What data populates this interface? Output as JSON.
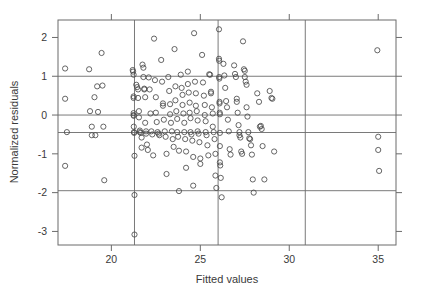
{
  "chart_data": {
    "type": "scatter",
    "title": "",
    "xlabel": "Fitted values",
    "ylabel": "Normalized residuals",
    "xlim": [
      17.0,
      36.0
    ],
    "ylim": [
      -3.35,
      2.45
    ],
    "xticks": [
      20,
      25,
      30,
      35
    ],
    "yticks": [
      2,
      1,
      0,
      -1,
      -2,
      -3
    ],
    "xtick_labels": [
      "20",
      "25",
      "30",
      "35"
    ],
    "ytick_labels": [
      "2",
      "1",
      "0",
      "-1",
      "-2",
      "-3"
    ],
    "grid": false,
    "legend": "none",
    "marker": "open-circle",
    "marker_size": 2.6,
    "marker_color": "#4a4a4a",
    "frame_color": "#6b6b6b",
    "reference_lines": {
      "vertical": [
        21.3,
        26.0,
        30.9
      ],
      "horizontal": [
        1.0,
        0.0,
        -0.45,
        -1.95
      ],
      "color": "#6b6b6b"
    },
    "points": [
      [
        17.4,
        1.2
      ],
      [
        17.4,
        0.42
      ],
      [
        17.4,
        -1.31
      ],
      [
        17.5,
        -0.44
      ],
      [
        18.75,
        1.18
      ],
      [
        18.8,
        0.1
      ],
      [
        18.9,
        -0.3
      ],
      [
        18.9,
        -0.52
      ],
      [
        19.05,
        0.46
      ],
      [
        19.1,
        -0.52
      ],
      [
        19.2,
        0.74
      ],
      [
        19.25,
        0.08
      ],
      [
        19.45,
        1.6
      ],
      [
        19.5,
        0.76
      ],
      [
        19.55,
        -0.3
      ],
      [
        19.6,
        -1.68
      ],
      [
        21.2,
        1.16
      ],
      [
        21.22,
        1.12
      ],
      [
        21.25,
        1.04
      ],
      [
        21.25,
        0.48
      ],
      [
        21.25,
        0.44
      ],
      [
        21.25,
        0.05
      ],
      [
        21.25,
        0.0
      ],
      [
        21.26,
        -0.02
      ],
      [
        21.26,
        -0.3
      ],
      [
        21.27,
        -0.44
      ],
      [
        21.28,
        -0.46
      ],
      [
        21.3,
        -1.05
      ],
      [
        21.3,
        -2.06
      ],
      [
        21.3,
        -3.08
      ],
      [
        21.4,
        0.78
      ],
      [
        21.45,
        0.72
      ],
      [
        21.5,
        0.66
      ],
      [
        21.5,
        0.44
      ],
      [
        21.55,
        0.1
      ],
      [
        21.55,
        -0.06
      ],
      [
        21.6,
        -0.4
      ],
      [
        21.6,
        -0.44
      ],
      [
        21.65,
        -0.46
      ],
      [
        21.7,
        -0.58
      ],
      [
        21.7,
        -0.84
      ],
      [
        21.75,
        1.3
      ],
      [
        21.8,
        1.22
      ],
      [
        21.8,
        0.98
      ],
      [
        21.85,
        0.68
      ],
      [
        21.85,
        0.66
      ],
      [
        21.9,
        0.46
      ],
      [
        21.9,
        -0.2
      ],
      [
        21.95,
        -0.42
      ],
      [
        21.95,
        -0.48
      ],
      [
        22.0,
        -0.76
      ],
      [
        22.05,
        -0.9
      ],
      [
        22.1,
        0.97
      ],
      [
        22.15,
        0.66
      ],
      [
        22.2,
        0.04
      ],
      [
        22.25,
        -0.42
      ],
      [
        22.3,
        -0.5
      ],
      [
        22.35,
        -1.04
      ],
      [
        22.4,
        1.97
      ],
      [
        22.45,
        0.9
      ],
      [
        22.5,
        0.46
      ],
      [
        22.5,
        0.06
      ],
      [
        22.55,
        -0.18
      ],
      [
        22.6,
        -0.44
      ],
      [
        22.65,
        -0.48
      ],
      [
        22.7,
        -0.52
      ],
      [
        22.8,
        1.42
      ],
      [
        22.85,
        0.86
      ],
      [
        22.9,
        0.3
      ],
      [
        22.9,
        0.24
      ],
      [
        22.95,
        -0.12
      ],
      [
        23.0,
        -0.42
      ],
      [
        23.05,
        -0.56
      ],
      [
        23.1,
        -1.0
      ],
      [
        23.1,
        -1.52
      ],
      [
        23.2,
        0.98
      ],
      [
        23.25,
        0.62
      ],
      [
        23.3,
        0.28
      ],
      [
        23.3,
        0.02
      ],
      [
        23.35,
        -0.2
      ],
      [
        23.4,
        -0.42
      ],
      [
        23.45,
        -0.62
      ],
      [
        23.5,
        -0.82
      ],
      [
        23.55,
        1.7
      ],
      [
        23.6,
        0.74
      ],
      [
        23.6,
        0.38
      ],
      [
        23.65,
        0.1
      ],
      [
        23.7,
        -0.1
      ],
      [
        23.7,
        -0.44
      ],
      [
        23.75,
        -0.56
      ],
      [
        23.8,
        -0.92
      ],
      [
        23.8,
        -1.96
      ],
      [
        23.9,
        1.04
      ],
      [
        23.95,
        0.7
      ],
      [
        24.0,
        0.52
      ],
      [
        24.0,
        0.26
      ],
      [
        24.05,
        0.04
      ],
      [
        24.1,
        -0.2
      ],
      [
        24.1,
        -0.44
      ],
      [
        24.15,
        -0.62
      ],
      [
        24.2,
        -0.94
      ],
      [
        24.2,
        -1.36
      ],
      [
        24.3,
        1.12
      ],
      [
        24.3,
        0.8
      ],
      [
        24.35,
        0.58
      ],
      [
        24.4,
        0.32
      ],
      [
        24.4,
        0.06
      ],
      [
        24.45,
        -0.08
      ],
      [
        24.45,
        -0.44
      ],
      [
        24.5,
        -0.5
      ],
      [
        24.55,
        -0.66
      ],
      [
        24.6,
        -1.08
      ],
      [
        24.6,
        -1.82
      ],
      [
        24.65,
        2.11
      ],
      [
        24.7,
        0.86
      ],
      [
        24.75,
        0.56
      ],
      [
        24.75,
        0.24
      ],
      [
        24.8,
        0.1
      ],
      [
        24.85,
        -0.14
      ],
      [
        24.85,
        -0.42
      ],
      [
        24.9,
        -0.48
      ],
      [
        24.95,
        -0.7
      ],
      [
        25.0,
        -1.12
      ],
      [
        25.0,
        -1.26
      ],
      [
        25.1,
        1.55
      ],
      [
        25.15,
        0.84
      ],
      [
        25.2,
        0.5
      ],
      [
        25.25,
        0.26
      ],
      [
        25.25,
        0.0
      ],
      [
        25.3,
        -0.16
      ],
      [
        25.3,
        -0.44
      ],
      [
        25.35,
        -0.52
      ],
      [
        25.4,
        -0.78
      ],
      [
        25.45,
        -1.04
      ],
      [
        25.5,
        1.05
      ],
      [
        25.55,
        1.04
      ],
      [
        25.6,
        0.6
      ],
      [
        25.6,
        0.56
      ],
      [
        25.65,
        0.2
      ],
      [
        25.7,
        0.04
      ],
      [
        25.7,
        -0.3
      ],
      [
        25.75,
        -0.44
      ],
      [
        25.8,
        -0.62
      ],
      [
        25.85,
        -1.0
      ],
      [
        25.85,
        -1.56
      ],
      [
        25.9,
        -1.88
      ],
      [
        26.05,
        2.21
      ],
      [
        26.05,
        1.45
      ],
      [
        26.06,
        1.4
      ],
      [
        26.06,
        0.98
      ],
      [
        26.07,
        0.94
      ],
      [
        26.08,
        0.34
      ],
      [
        26.08,
        0.3
      ],
      [
        26.09,
        0.06
      ],
      [
        26.1,
        0.02
      ],
      [
        26.1,
        -0.46
      ],
      [
        26.1,
        -0.8
      ],
      [
        26.1,
        -1.22
      ],
      [
        26.12,
        -1.3
      ],
      [
        26.15,
        -1.62
      ],
      [
        26.2,
        -2.12
      ],
      [
        26.3,
        1.32
      ],
      [
        26.35,
        1.02
      ],
      [
        26.4,
        0.7
      ],
      [
        26.45,
        0.36
      ],
      [
        26.5,
        0.2
      ],
      [
        26.55,
        -0.12
      ],
      [
        26.6,
        -0.42
      ],
      [
        26.65,
        -0.88
      ],
      [
        26.7,
        -1.02
      ],
      [
        26.9,
        1.28
      ],
      [
        26.95,
        1.06
      ],
      [
        27.0,
        0.98
      ],
      [
        27.05,
        0.42
      ],
      [
        27.05,
        0.34
      ],
      [
        27.1,
        0.06
      ],
      [
        27.15,
        -0.26
      ],
      [
        27.2,
        -0.44
      ],
      [
        27.2,
        -0.52
      ],
      [
        27.25,
        -0.58
      ],
      [
        27.3,
        -0.94
      ],
      [
        27.35,
        -1.0
      ],
      [
        27.4,
        1.9
      ],
      [
        27.45,
        1.18
      ],
      [
        27.5,
        1.14
      ],
      [
        27.5,
        0.98
      ],
      [
        27.55,
        0.86
      ],
      [
        27.6,
        0.78
      ],
      [
        27.6,
        0.2
      ],
      [
        27.65,
        -0.04
      ],
      [
        27.7,
        -0.44
      ],
      [
        27.75,
        -0.6
      ],
      [
        27.8,
        -0.62
      ],
      [
        27.85,
        -0.78
      ],
      [
        27.9,
        -1.02
      ],
      [
        27.95,
        -1.66
      ],
      [
        28.0,
        -2.0
      ],
      [
        28.2,
        0.56
      ],
      [
        28.3,
        0.34
      ],
      [
        28.35,
        -0.3
      ],
      [
        28.4,
        -0.28
      ],
      [
        28.45,
        -0.36
      ],
      [
        28.5,
        -0.8
      ],
      [
        28.6,
        -1.66
      ],
      [
        28.9,
        0.62
      ],
      [
        29.0,
        0.44
      ],
      [
        29.05,
        0.42
      ],
      [
        29.15,
        -0.94
      ],
      [
        34.95,
        1.67
      ],
      [
        35.0,
        -0.56
      ],
      [
        35.0,
        -0.9
      ],
      [
        35.05,
        -1.44
      ]
    ]
  }
}
